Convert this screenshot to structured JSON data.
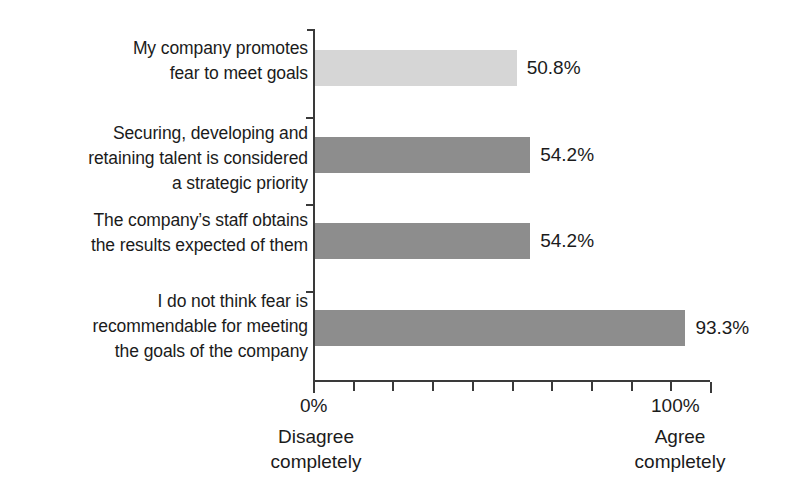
{
  "chart_data": {
    "type": "bar",
    "orientation": "horizontal",
    "title": "",
    "xlabel": "",
    "ylabel": "",
    "xlim": [
      0,
      100
    ],
    "grid": false,
    "legend": false,
    "categories": [
      "My company promotes fear to meet goals",
      "Securing, developing and retaining talent is considered a strategic priority",
      "The company’s staff obtains the results expected of them",
      "I do not think fear is recommendable for meeting the goals of the company"
    ],
    "values": [
      50.8,
      54.2,
      54.2,
      93.3
    ],
    "value_labels": [
      "50.8%",
      "54.2%",
      "54.2%",
      "93.3%"
    ],
    "bar_colors": [
      "#d6d6d6",
      "#8d8d8d",
      "#8d8d8d",
      "#8d8d8d"
    ],
    "axis_ticks": [
      0,
      10,
      20,
      30,
      40,
      50,
      60,
      70,
      80,
      90,
      100
    ],
    "axis_tick_labels": [
      "0%",
      "100%"
    ],
    "axis_anchors": {
      "left": [
        "Disagree",
        "completely"
      ],
      "right": [
        "Agree",
        "completely"
      ]
    }
  },
  "categories_wrapped": [
    [
      "My company promotes",
      "fear to meet goals"
    ],
    [
      "Securing, developing and",
      "retaining talent is considered",
      "a strategic priority"
    ],
    [
      "The company’s staff obtains",
      "the results expected of them"
    ],
    [
      "I do not think fear is",
      "recommendable for meeting",
      "the goals of the company"
    ]
  ],
  "axis": {
    "left_tick_label": "0%",
    "right_tick_label": "100%",
    "left_anchor_line1": "Disagree",
    "left_anchor_line2": "completely",
    "right_anchor_line1": "Agree",
    "right_anchor_line2": "completely"
  },
  "colors": {
    "bar_light": "#d6d6d6",
    "bar_dark": "#8d8d8d",
    "axis": "#3a3a3a",
    "text": "#1b1b1b",
    "background": "#ffffff"
  }
}
